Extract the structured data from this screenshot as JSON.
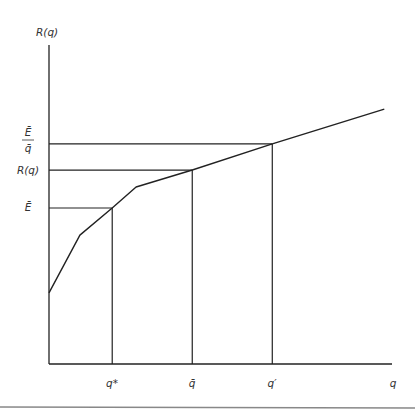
{
  "chart_data": {
    "type": "line",
    "title": "",
    "ylabel": "R(q)",
    "xlabel": "q",
    "xlim": [
      0,
      102
    ],
    "ylim": [
      0,
      100
    ],
    "grid": false,
    "series": [
      {
        "name": "R(q)",
        "points": [
          [
            0,
            22.3
          ],
          [
            9.2,
            40.4
          ],
          [
            18.8,
            48.9
          ],
          [
            25.9,
            55.5
          ],
          [
            42.6,
            60.8
          ],
          [
            66.4,
            69.0
          ],
          [
            99.7,
            79.9
          ]
        ]
      }
    ],
    "reference_points": [
      {
        "x": 18.8,
        "y": 48.9,
        "x_label": "q*",
        "y_label": "Ē"
      },
      {
        "x": 42.6,
        "y": 60.8,
        "x_label": "q̄",
        "y_label": "R(q)"
      },
      {
        "x": 66.4,
        "y": 69.0,
        "x_label": "q′",
        "y_label": "Ē/q̄"
      }
    ],
    "y_tick_labels": {
      "e_bar_over_q_bar_num": "Ē",
      "e_bar_over_q_bar_den": "q̄",
      "r_of_q": "R(q)",
      "e_bar": "Ē"
    },
    "x_tick_labels": {
      "q_star": "q*",
      "q_bar": "q̄",
      "q_prime": "q′",
      "q": "q"
    }
  }
}
